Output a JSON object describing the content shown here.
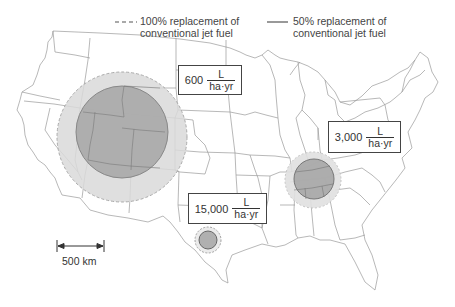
{
  "legend": {
    "dashed": {
      "line_style": "dashed",
      "label_line1": "100% replacement of",
      "label_line2": "conventional jet fuel"
    },
    "solid": {
      "line_style": "solid",
      "label_line1": "50% replacement of",
      "label_line2": "conventional jet fuel"
    }
  },
  "regions": [
    {
      "name": "west",
      "yield_value": "600",
      "unit_num": "L",
      "unit_den": "ha·yr",
      "circle_100pct_radius_px": 65,
      "circle_50pct_radius_px": 46
    },
    {
      "name": "southeast",
      "yield_value": "3,000",
      "unit_num": "L",
      "unit_den": "ha·yr",
      "circle_100pct_radius_px": 28,
      "circle_50pct_radius_px": 20
    },
    {
      "name": "texas",
      "yield_value": "15,000",
      "unit_num": "L",
      "unit_den": "ha·yr",
      "circle_100pct_radius_px": 13,
      "circle_50pct_radius_px": 9
    }
  ],
  "scale_bar": {
    "label": "500 km"
  },
  "colors": {
    "outer_fill": "#d9d9d9",
    "inner_fill": "#a6a6a6",
    "border": "#888888",
    "map_lines": "#9a9a9a"
  }
}
